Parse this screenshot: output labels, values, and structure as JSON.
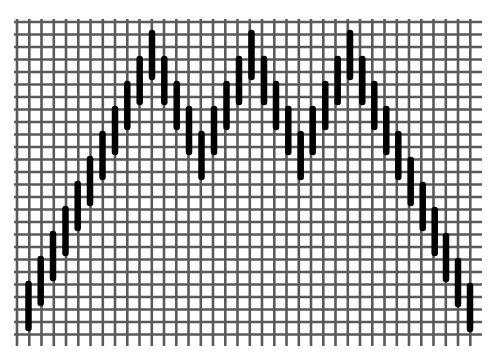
{
  "diagram": {
    "type": "pattern-grid",
    "colors": {
      "background": "#ffffff",
      "grid": "#5a5a5a",
      "bar": "#000000"
    },
    "grid": {
      "x_start": 17,
      "x_end": 482,
      "x_spacing": 12.25,
      "y_start": 22,
      "y_end": 340,
      "y_spacing": 12.5,
      "vertical_line_overhang": 6,
      "horizontal_line_overhang": 3
    },
    "bars": [
      {
        "x": 28.5,
        "y1": 284,
        "y2": 328
      },
      {
        "x": 40.7,
        "y1": 259,
        "y2": 303
      },
      {
        "x": 53.0,
        "y1": 234,
        "y2": 278
      },
      {
        "x": 65.5,
        "y1": 209,
        "y2": 253
      },
      {
        "x": 77.7,
        "y1": 184,
        "y2": 228
      },
      {
        "x": 90.0,
        "y1": 159,
        "y2": 203
      },
      {
        "x": 102.5,
        "y1": 134,
        "y2": 177
      },
      {
        "x": 115.0,
        "y1": 109,
        "y2": 152
      },
      {
        "x": 127.3,
        "y1": 84,
        "y2": 127
      },
      {
        "x": 139.7,
        "y1": 59,
        "y2": 102
      },
      {
        "x": 152.0,
        "y1": 33,
        "y2": 77
      },
      {
        "x": 164.3,
        "y1": 59,
        "y2": 102
      },
      {
        "x": 176.7,
        "y1": 84,
        "y2": 127
      },
      {
        "x": 189.0,
        "y1": 109,
        "y2": 152
      },
      {
        "x": 201.5,
        "y1": 134,
        "y2": 177
      },
      {
        "x": 214.0,
        "y1": 109,
        "y2": 152
      },
      {
        "x": 226.5,
        "y1": 84,
        "y2": 127
      },
      {
        "x": 239.0,
        "y1": 59,
        "y2": 102
      },
      {
        "x": 251.5,
        "y1": 33,
        "y2": 77
      },
      {
        "x": 264.0,
        "y1": 59,
        "y2": 102
      },
      {
        "x": 276.0,
        "y1": 84,
        "y2": 127
      },
      {
        "x": 288.3,
        "y1": 109,
        "y2": 152
      },
      {
        "x": 300.7,
        "y1": 134,
        "y2": 177
      },
      {
        "x": 312.7,
        "y1": 109,
        "y2": 152
      },
      {
        "x": 325.3,
        "y1": 84,
        "y2": 127
      },
      {
        "x": 337.7,
        "y1": 59,
        "y2": 102
      },
      {
        "x": 350.0,
        "y1": 33,
        "y2": 77
      },
      {
        "x": 362.3,
        "y1": 59,
        "y2": 102
      },
      {
        "x": 374.3,
        "y1": 84,
        "y2": 127
      },
      {
        "x": 386.3,
        "y1": 109,
        "y2": 152
      },
      {
        "x": 398.3,
        "y1": 134,
        "y2": 177
      },
      {
        "x": 410.7,
        "y1": 160,
        "y2": 203
      },
      {
        "x": 422.7,
        "y1": 185,
        "y2": 228
      },
      {
        "x": 434.7,
        "y1": 210,
        "y2": 253
      },
      {
        "x": 446.0,
        "y1": 236,
        "y2": 279
      },
      {
        "x": 458.0,
        "y1": 261,
        "y2": 304
      },
      {
        "x": 470.0,
        "y1": 286,
        "y2": 329
      }
    ]
  }
}
